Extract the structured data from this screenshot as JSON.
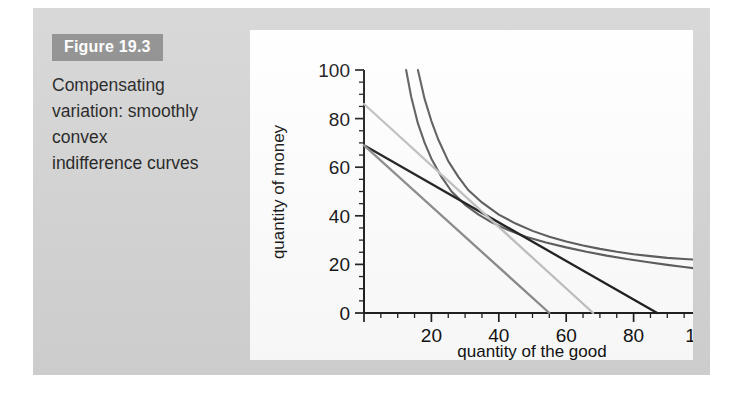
{
  "figure": {
    "badge_label": "Figure 19.3",
    "caption": "Compensating variation: smoothly convex indifference curves",
    "badge_color": "#8b8b8b",
    "page_background": "#d4d4d4",
    "panel_background": "#ffffff"
  },
  "chart_data": {
    "type": "line",
    "title": "",
    "xlabel": "quantity of the good",
    "ylabel": "quantity of money",
    "xlim": [
      0,
      100
    ],
    "ylim": [
      0,
      100
    ],
    "xticks": [
      0,
      20,
      40,
      60,
      80,
      100
    ],
    "yticks": [
      0,
      20,
      40,
      60,
      80,
      100
    ],
    "xtick_labels": [
      "0",
      "20",
      "40",
      "60",
      "80",
      "100"
    ],
    "ytick_labels": [
      "0",
      "20",
      "40",
      "60",
      "80",
      "100"
    ],
    "minor_tick_step": 5,
    "grid": false,
    "legend": "none",
    "series": [
      {
        "name": "indifference-curve-upper",
        "role": "indifference curve",
        "color": "#5a5a5a",
        "width": 2.1,
        "points": [
          [
            16,
            100
          ],
          [
            18,
            88
          ],
          [
            20,
            79
          ],
          [
            22,
            71.5
          ],
          [
            25,
            62.5
          ],
          [
            28,
            56
          ],
          [
            31,
            50.5
          ],
          [
            35,
            45.5
          ],
          [
            40,
            40.5
          ],
          [
            45,
            36.8
          ],
          [
            50,
            33.8
          ],
          [
            55,
            31.4
          ],
          [
            60,
            29.4
          ],
          [
            65,
            27.8
          ],
          [
            70,
            26.4
          ],
          [
            75,
            25.2
          ],
          [
            80,
            24.2
          ],
          [
            85,
            23.4
          ],
          [
            90,
            22.7
          ],
          [
            95,
            22.2
          ],
          [
            100,
            21.8
          ]
        ]
      },
      {
        "name": "indifference-curve-lower",
        "role": "indifference curve",
        "color": "#5a5a5a",
        "width": 2.1,
        "points": [
          [
            12.5,
            100
          ],
          [
            14,
            89
          ],
          [
            16,
            78
          ],
          [
            18,
            70
          ],
          [
            20,
            63.5
          ],
          [
            23,
            56
          ],
          [
            26,
            50
          ],
          [
            30,
            44.5
          ],
          [
            34,
            40.5
          ],
          [
            38,
            37.2
          ],
          [
            43,
            34
          ],
          [
            48,
            31.4
          ],
          [
            54,
            29
          ],
          [
            60,
            27
          ],
          [
            66,
            25.2
          ],
          [
            72,
            23.6
          ],
          [
            78,
            22.2
          ],
          [
            84,
            21
          ],
          [
            90,
            19.8
          ],
          [
            95,
            18.9
          ],
          [
            100,
            18.1
          ]
        ]
      },
      {
        "name": "budget-line-dark",
        "role": "budget line",
        "color": "#1c1c1c",
        "width": 2.3,
        "points": [
          [
            0,
            69
          ],
          [
            87,
            0
          ]
        ]
      },
      {
        "name": "budget-line-mid",
        "role": "budget line",
        "color": "#8a8a8a",
        "width": 2.3,
        "points": [
          [
            0,
            69
          ],
          [
            55,
            0
          ]
        ]
      },
      {
        "name": "budget-line-light",
        "role": "budget line",
        "color": "#c0c0c0",
        "width": 2.3,
        "points": [
          [
            0,
            86
          ],
          [
            68,
            0
          ]
        ]
      }
    ]
  }
}
